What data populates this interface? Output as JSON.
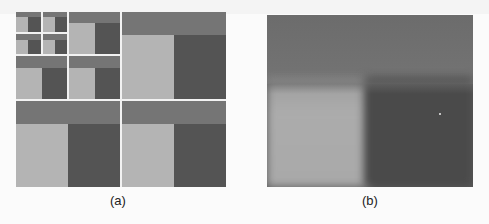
{
  "figure": {
    "panels": [
      {
        "id": "a",
        "label": "(a)",
        "description": "recursive grid of light/dark/mid-gray blocks"
      },
      {
        "id": "b",
        "label": "(b)",
        "description": "blurred single block pattern"
      }
    ],
    "colors": {
      "band": "#757575",
      "light": "#b4b4b4",
      "dark": "#545454",
      "divider": "#f2f2f2"
    }
  }
}
